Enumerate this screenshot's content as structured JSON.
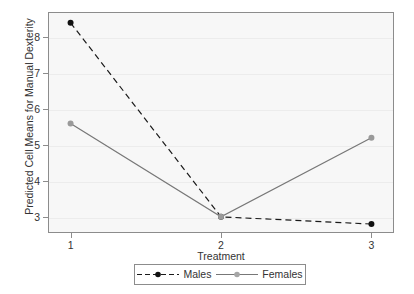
{
  "chart_data": {
    "type": "line",
    "title": "",
    "xlabel": "Treatment",
    "ylabel": "Predicted Cell Means for Manual Dexterity",
    "categories": [
      "1",
      "2",
      "3"
    ],
    "x": [
      1,
      2,
      3
    ],
    "xlim": [
      0.85,
      3.15
    ],
    "ylim": [
      2.55,
      8.7
    ],
    "yticks": [
      3,
      4,
      5,
      6,
      7,
      8
    ],
    "ytick_labels": [
      "3",
      "4",
      "5",
      "6",
      "7",
      "8"
    ],
    "xticks": [
      1,
      2,
      3
    ],
    "xtick_labels": [
      "1",
      "2",
      "3"
    ],
    "grid": true,
    "grid_axis": "y",
    "legend_position": "bottom",
    "series": [
      {
        "name": "Males",
        "values": [
          8.4,
          3.0,
          2.8
        ],
        "color": "#1a1a1a",
        "linestyle": "dashed",
        "marker": "circle",
        "marker_color": "#111111"
      },
      {
        "name": "Females",
        "values": [
          5.6,
          3.0,
          5.2
        ],
        "color": "#777777",
        "linestyle": "solid",
        "marker": "circle",
        "marker_color": "#9a9a9a"
      }
    ]
  },
  "legend": {
    "entries": [
      {
        "label": "Males"
      },
      {
        "label": "Females"
      }
    ]
  },
  "colors": {
    "plot_background": "#f7f7f7",
    "frame": "#8c8c8c",
    "gridline": "#ececec",
    "males": "#1a1a1a",
    "females": "#777777",
    "text": "#333333"
  }
}
